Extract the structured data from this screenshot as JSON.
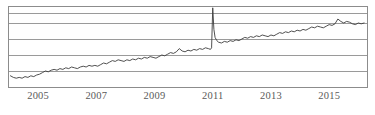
{
  "chart_data": {
    "type": "line",
    "title": "",
    "subtitle": "",
    "xlabel": "",
    "ylabel": "",
    "grid": true,
    "legend": false,
    "legend_position": "none",
    "xlim": [
      2004.0,
      2016.3
    ],
    "ylim": [
      0,
      100
    ],
    "xticks": [
      2005,
      2007,
      2009,
      2011,
      2013,
      2015
    ],
    "xtick_labels": [
      "2005",
      "2007",
      "2009",
      "2011",
      "2013",
      "2015"
    ],
    "yticks": [],
    "ytick_labels": [],
    "gridlines_y": [
      20,
      40,
      60,
      80,
      93
    ],
    "line_color": "#3c3c3c",
    "grid_color": "#9a9a9a",
    "frame_color": "#8c8c8c",
    "background": "#ffffff",
    "annotations": [
      {
        "text": "spike",
        "x": 2010.95,
        "y": 99
      }
    ],
    "series": [
      {
        "name": "series-1",
        "x": [
          2004.05,
          2004.15,
          2004.25,
          2004.35,
          2004.45,
          2004.55,
          2004.65,
          2004.75,
          2004.85,
          2004.95,
          2005.05,
          2005.15,
          2005.25,
          2005.35,
          2005.45,
          2005.55,
          2005.65,
          2005.75,
          2005.85,
          2005.95,
          2006.05,
          2006.15,
          2006.25,
          2006.35,
          2006.45,
          2006.55,
          2006.65,
          2006.75,
          2006.85,
          2006.95,
          2007.05,
          2007.15,
          2007.25,
          2007.35,
          2007.45,
          2007.55,
          2007.65,
          2007.75,
          2007.85,
          2007.95,
          2008.05,
          2008.15,
          2008.25,
          2008.35,
          2008.45,
          2008.55,
          2008.65,
          2008.75,
          2008.85,
          2008.95,
          2009.05,
          2009.15,
          2009.25,
          2009.35,
          2009.45,
          2009.55,
          2009.65,
          2009.75,
          2009.85,
          2009.95,
          2010.05,
          2010.15,
          2010.25,
          2010.35,
          2010.45,
          2010.55,
          2010.65,
          2010.75,
          2010.85,
          2010.92,
          2010.96,
          2011.0,
          2011.04,
          2011.08,
          2011.14,
          2011.2,
          2011.3,
          2011.4,
          2011.5,
          2011.6,
          2011.7,
          2011.8,
          2011.9,
          2012.0,
          2012.1,
          2012.2,
          2012.3,
          2012.4,
          2012.5,
          2012.6,
          2012.7,
          2012.8,
          2012.9,
          2013.0,
          2013.1,
          2013.2,
          2013.3,
          2013.4,
          2013.5,
          2013.6,
          2013.7,
          2013.8,
          2013.9,
          2014.0,
          2014.1,
          2014.2,
          2014.3,
          2014.4,
          2014.5,
          2014.6,
          2014.7,
          2014.8,
          2014.9,
          2015.0,
          2015.1,
          2015.2,
          2015.3,
          2015.4,
          2015.5,
          2015.6,
          2015.7,
          2015.8,
          2015.9,
          2016.0,
          2016.1,
          2016.2
        ],
        "y": [
          14,
          12,
          11,
          12,
          11,
          13,
          12,
          14,
          13,
          15,
          16,
          18,
          20,
          19,
          21,
          22,
          21,
          23,
          22,
          24,
          23,
          25,
          24,
          23,
          25,
          26,
          25,
          27,
          26,
          27,
          26,
          28,
          30,
          29,
          31,
          33,
          32,
          34,
          33,
          32,
          34,
          33,
          35,
          34,
          36,
          35,
          37,
          36,
          38,
          37,
          36,
          38,
          40,
          39,
          41,
          43,
          42,
          44,
          48,
          45,
          44,
          46,
          45,
          47,
          46,
          48,
          47,
          49,
          48,
          47,
          49,
          99,
          72,
          62,
          58,
          56,
          55,
          57,
          56,
          58,
          57,
          59,
          58,
          60,
          62,
          61,
          63,
          62,
          64,
          63,
          65,
          64,
          63,
          65,
          64,
          66,
          68,
          67,
          69,
          68,
          70,
          69,
          71,
          70,
          72,
          71,
          73,
          75,
          74,
          76,
          75,
          74,
          76,
          78,
          77,
          79,
          85,
          82,
          80,
          82,
          81,
          79,
          78,
          80,
          79,
          80
        ]
      }
    ]
  },
  "axis": {
    "tick_labels": [
      "2005",
      "2007",
      "2009",
      "2011",
      "2013",
      "2015"
    ]
  }
}
